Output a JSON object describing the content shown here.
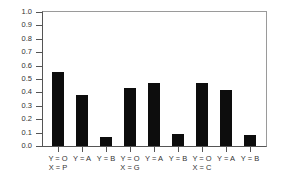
{
  "chart_data": {
    "type": "bar",
    "title": "",
    "xlabel": "",
    "ylabel": "",
    "ylim": [
      0.0,
      1.0
    ],
    "yticks": [
      "0.0",
      "0.1",
      "0.2",
      "0.3",
      "0.4",
      "0.5",
      "0.6",
      "0.7",
      "0.8",
      "0.9",
      "1.0"
    ],
    "grid": false,
    "legend": null,
    "categories": [
      "Y = O",
      "Y = A",
      "Y = B",
      "Y = O",
      "Y = A",
      "Y = B",
      "Y = O",
      "Y = A",
      "Y = B"
    ],
    "groups": [
      {
        "label": "X = P",
        "categories": [
          "Y = O",
          "Y = A",
          "Y = B"
        ],
        "values": [
          0.55,
          0.38,
          0.07
        ]
      },
      {
        "label": "X = G",
        "categories": [
          "Y = O",
          "Y = A",
          "Y = B"
        ],
        "values": [
          0.43,
          0.47,
          0.09
        ]
      },
      {
        "label": "X = C",
        "categories": [
          "Y = O",
          "Y = A",
          "Y = B"
        ],
        "values": [
          0.47,
          0.42,
          0.08
        ]
      }
    ],
    "values": [
      0.55,
      0.38,
      0.07,
      0.43,
      0.47,
      0.09,
      0.47,
      0.42,
      0.08
    ],
    "bar_color": "#0d0d0d"
  }
}
